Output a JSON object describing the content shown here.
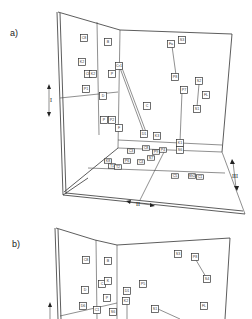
{
  "panels": [
    {
      "label": "a)",
      "axes": {
        "I": "I",
        "II": "II",
        "III": "III"
      },
      "markers": [
        {
          "text": "C8",
          "x": 84,
          "y": 38
        },
        {
          "text": "B",
          "x": 108,
          "y": 42
        },
        {
          "text": "K2",
          "x": 82,
          "y": 62
        },
        {
          "text": "C8",
          "x": 88,
          "y": 74
        },
        {
          "text": "K2",
          "x": 93,
          "y": 74
        },
        {
          "text": "Cr1",
          "x": 119,
          "y": 66
        },
        {
          "text": "P",
          "x": 112,
          "y": 74
        },
        {
          "text": "P1",
          "x": 86,
          "y": 89
        },
        {
          "text": "D",
          "x": 103,
          "y": 96
        },
        {
          "text": "Fa",
          "x": 171,
          "y": 44
        },
        {
          "text": "S3",
          "x": 182,
          "y": 40
        },
        {
          "text": "P8",
          "x": 175,
          "y": 77
        },
        {
          "text": "S2",
          "x": 199,
          "y": 81
        },
        {
          "text": "P7",
          "x": 184,
          "y": 90
        },
        {
          "text": "FL",
          "x": 206,
          "y": 95
        },
        {
          "text": "S1",
          "x": 197,
          "y": 109
        },
        {
          "text": "C",
          "x": 147,
          "y": 106
        },
        {
          "text": "D1",
          "x": 144,
          "y": 134
        },
        {
          "text": "K3",
          "x": 157,
          "y": 136
        },
        {
          "text": "K1",
          "x": 180,
          "y": 143
        },
        {
          "text": "S6",
          "x": 180,
          "y": 150
        },
        {
          "text": "P",
          "x": 104,
          "y": 120
        },
        {
          "text": "P2",
          "x": 112,
          "y": 120
        },
        {
          "text": "F",
          "x": 119,
          "y": 128
        }
      ],
      "floor_markers": [
        {
          "text": "C3",
          "x": 131,
          "y": 151
        },
        {
          "text": "C8",
          "x": 146,
          "y": 148
        },
        {
          "text": "P9",
          "x": 156,
          "y": 152
        },
        {
          "text": "P4",
          "x": 163,
          "y": 150
        },
        {
          "text": "K8",
          "x": 108,
          "y": 161
        },
        {
          "text": "P6",
          "x": 127,
          "y": 161
        },
        {
          "text": "C4",
          "x": 141,
          "y": 162
        },
        {
          "text": "S7",
          "x": 151,
          "y": 158
        },
        {
          "text": "T1",
          "x": 112,
          "y": 166
        },
        {
          "text": "T2",
          "x": 118,
          "y": 167
        },
        {
          "text": "C5",
          "x": 175,
          "y": 176
        },
        {
          "text": "Sh2",
          "x": 192,
          "y": 176
        },
        {
          "text": "C1",
          "x": 200,
          "y": 177
        }
      ]
    },
    {
      "label": "b)",
      "axes": {
        "I": "I"
      },
      "markers": [
        {
          "text": "C8",
          "x": 86,
          "y": 260
        },
        {
          "text": "B",
          "x": 108,
          "y": 261
        },
        {
          "text": "S3",
          "x": 178,
          "y": 254
        },
        {
          "text": "P8",
          "x": 195,
          "y": 257
        },
        {
          "text": "S4",
          "x": 207,
          "y": 279
        },
        {
          "text": "P5",
          "x": 143,
          "y": 284
        },
        {
          "text": "D",
          "x": 85,
          "y": 290
        },
        {
          "text": "C",
          "x": 102,
          "y": 284
        },
        {
          "text": "K",
          "x": 108,
          "y": 281
        },
        {
          "text": "D1",
          "x": 127,
          "y": 291
        },
        {
          "text": "K2",
          "x": 126,
          "y": 301
        },
        {
          "text": "P",
          "x": 107,
          "y": 298
        },
        {
          "text": "FL",
          "x": 204,
          "y": 306
        },
        {
          "text": "S1",
          "x": 155,
          "y": 309
        },
        {
          "text": "D6",
          "x": 83,
          "y": 306
        },
        {
          "text": "C1",
          "x": 97,
          "y": 310
        },
        {
          "text": "S6",
          "x": 113,
          "y": 312
        }
      ]
    }
  ]
}
